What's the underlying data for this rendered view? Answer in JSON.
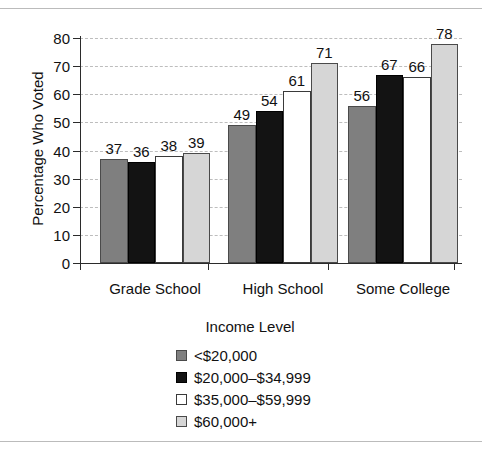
{
  "chart_data": {
    "type": "bar",
    "title": "",
    "categories": [
      "Grade School",
      "High School",
      "Some College"
    ],
    "series": [
      {
        "name": "<$20,000",
        "values": [
          37,
          49,
          56
        ],
        "color": "#7f7f7f"
      },
      {
        "name": "$20,000–$34,999",
        "values": [
          36,
          54,
          67
        ],
        "color": "#131313"
      },
      {
        "name": "$35,000–$59,999",
        "values": [
          38,
          61,
          66
        ],
        "color": "#ffffff"
      },
      {
        "name": "$60,000+",
        "values": [
          39,
          71,
          78
        ],
        "color": "#d6d6d6"
      }
    ],
    "xlabel": "",
    "ylabel": "Percentage Who Voted",
    "ylim": [
      0,
      80
    ],
    "ytick_labels": [
      "80",
      "70",
      "60",
      "50",
      "40",
      "30",
      "20",
      "10",
      "0"
    ],
    "ytick_values": [
      80,
      70,
      60,
      50,
      40,
      30,
      20,
      10,
      0
    ],
    "grid": true,
    "grid_style": "dashed-horizontal",
    "legend_title": "Income Level",
    "legend_position": "bottom-center",
    "data_labels": true
  }
}
